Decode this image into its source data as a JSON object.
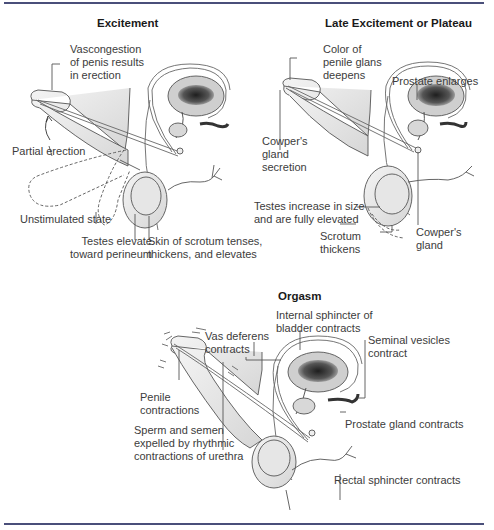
{
  "diagram": {
    "colors": {
      "rule": "#4a4f7a",
      "text": "#3c3c3c",
      "title": "#1a1a1a",
      "tissue": "#e8e8e8",
      "bladder_dark": "#2a2a2a"
    },
    "panels": [
      {
        "id": "excitement",
        "title": "Excitement",
        "labels": [
          "Vascongestion\nof penis results\nin erection",
          "Partial erection",
          "Unstimulated state",
          "Testes elevate\ntoward perineum",
          "Skin of scrotum tenses,\nthickens, and elevates"
        ]
      },
      {
        "id": "late-excitement-plateau",
        "title": "Late Excitement or Plateau",
        "labels": [
          "Color of\npenile glans\ndeepens",
          "Prostate enlarges",
          "Cowper's\ngland\nsecretion",
          "Testes increase in size\nand are fully elevated",
          "Scrotum\nthickens",
          "Cowper's\ngland"
        ]
      },
      {
        "id": "orgasm",
        "title": "Orgasm",
        "labels": [
          "Internal sphincter of\nbladder contracts",
          "Vas deferens\ncontracts",
          "Seminal vesicles\ncontract",
          "Penile\ncontractions",
          "Prostate gland contracts",
          "Sperm and semen\nexpelled by rhythmic\ncontractions of urethra",
          "Rectal sphincter contracts"
        ]
      }
    ]
  }
}
